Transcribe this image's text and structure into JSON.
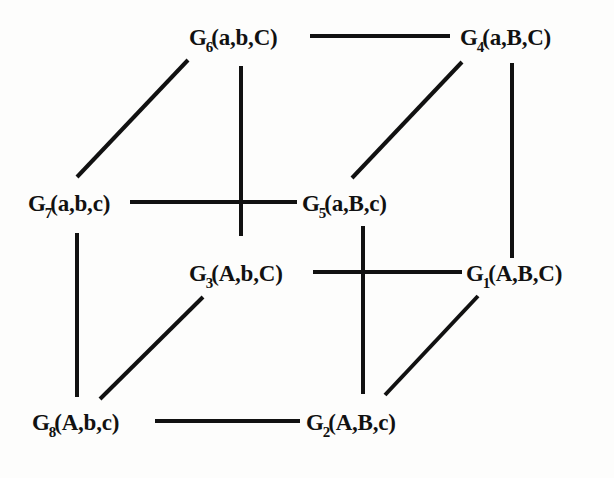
{
  "figure": {
    "type": "cube-graph",
    "background_color": "#fdfdfc",
    "ink_color": "#111111",
    "width": 614,
    "height": 478
  },
  "vertices": [
    {
      "id": "G1",
      "name": "G",
      "subscript": "1",
      "args": "(A,B,C)",
      "full_label": "G1(A,B,C)",
      "x": 470,
      "y": 272,
      "label_x": 466,
      "label_y": 262,
      "anchor": "left"
    },
    {
      "id": "G2",
      "name": "G",
      "subscript": "2",
      "args": "(A,B,c)",
      "full_label": "G2(A,B,c)",
      "x": 363,
      "y": 421,
      "label_x": 306,
      "label_y": 411,
      "anchor": "left"
    },
    {
      "id": "G3",
      "name": "G",
      "subscript": "3",
      "args": "(A,b,C)",
      "full_label": "G3(A,b,C)",
      "x": 190,
      "y": 272,
      "label_x": 189,
      "label_y": 262,
      "anchor": "left"
    },
    {
      "id": "G4",
      "name": "G",
      "subscript": "4",
      "args": "(a,B,C)",
      "full_label": "G4(a,B,C)",
      "x": 455,
      "y": 36,
      "label_x": 460,
      "label_y": 26,
      "anchor": "left"
    },
    {
      "id": "G5",
      "name": "G",
      "subscript": "5",
      "args": "(a,B,c)",
      "full_label": "G5(a,B,c)",
      "x": 300,
      "y": 202,
      "label_x": 302,
      "label_y": 192,
      "anchor": "left"
    },
    {
      "id": "G6",
      "name": "G",
      "subscript": "6",
      "args": "(a,b,C)",
      "full_label": "G6(a,b,C)",
      "x": 193,
      "y": 36,
      "label_x": 189,
      "label_y": 26,
      "anchor": "left"
    },
    {
      "id": "G7",
      "name": "G",
      "subscript": "7",
      "args": "(a,b,c)",
      "full_label": "G7(a,b,c)",
      "x": 78,
      "y": 202,
      "label_x": 28,
      "label_y": 192,
      "anchor": "left"
    },
    {
      "id": "G8",
      "name": "G",
      "subscript": "8",
      "args": "(A,b,c)",
      "full_label": "G8(A,b,c)",
      "x": 78,
      "y": 421,
      "label_x": 32,
      "label_y": 411,
      "anchor": "left"
    }
  ],
  "edges": [
    {
      "id": "e-g6-g4",
      "from": "G6",
      "to": "G4",
      "orientation": "horizontal",
      "x1": 310,
      "y1": 36,
      "x2": 450,
      "y2": 36
    },
    {
      "id": "e-g7-g5",
      "from": "G7",
      "to": "G5",
      "orientation": "horizontal",
      "x1": 130,
      "y1": 202,
      "x2": 297,
      "y2": 202
    },
    {
      "id": "e-g3-g1",
      "from": "G3",
      "to": "G1",
      "orientation": "horizontal",
      "x1": 313,
      "y1": 272,
      "x2": 462,
      "y2": 272
    },
    {
      "id": "e-g8-g2",
      "from": "G8",
      "to": "G2",
      "orientation": "horizontal",
      "x1": 155,
      "y1": 421,
      "x2": 300,
      "y2": 421
    },
    {
      "id": "e-g6-g5",
      "from": "G6",
      "to": "G5",
      "orientation": "vertical",
      "x1": 241,
      "y1": 66,
      "x2": 241,
      "y2": 236
    },
    {
      "id": "e-g4-g1",
      "from": "G4",
      "to": "G1",
      "orientation": "vertical",
      "x1": 512,
      "y1": 63,
      "x2": 512,
      "y2": 258
    },
    {
      "id": "e-g7-g8",
      "from": "G7",
      "to": "G8",
      "orientation": "vertical",
      "x1": 77,
      "y1": 233,
      "x2": 77,
      "y2": 397
    },
    {
      "id": "e-g5-g2",
      "from": "G5",
      "to": "G2",
      "orientation": "vertical",
      "x1": 363,
      "y1": 226,
      "x2": 363,
      "y2": 394
    },
    {
      "id": "e-g7-g6",
      "from": "G7",
      "to": "G6",
      "orientation": "diagonal",
      "x1": 77,
      "y1": 177,
      "x2": 188,
      "y2": 60
    },
    {
      "id": "e-g5-g4",
      "from": "G5",
      "to": "G4",
      "orientation": "diagonal",
      "x1": 352,
      "y1": 178,
      "x2": 462,
      "y2": 62
    },
    {
      "id": "e-g8-g3",
      "from": "G8",
      "to": "G3",
      "orientation": "diagonal",
      "x1": 100,
      "y1": 399,
      "x2": 203,
      "y2": 297
    },
    {
      "id": "e-g2-g1",
      "from": "G2",
      "to": "G1",
      "orientation": "diagonal",
      "x1": 385,
      "y1": 395,
      "x2": 478,
      "y2": 296
    }
  ],
  "stroke": {
    "width": 4,
    "color": "#111111"
  }
}
